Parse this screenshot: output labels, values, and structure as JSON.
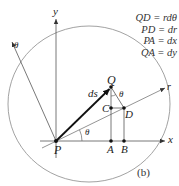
{
  "figure": {
    "caption": "(b)",
    "equations": [
      {
        "lhs": "QD",
        "rhs": "rdθ",
        "text": "QD = rdθ"
      },
      {
        "lhs": "PD",
        "rhs": "dr",
        "text": "PD = dr"
      },
      {
        "lhs": "PA",
        "rhs": "dx",
        "text": "PA = dx"
      },
      {
        "lhs": "QA",
        "rhs": "dy",
        "text": "QA = dy"
      }
    ],
    "axes": {
      "x_label": "x",
      "y_label": "y",
      "r_label": "r",
      "theta_axis_label": "θ"
    },
    "points": {
      "P": "P",
      "Q": "Q",
      "C": "C",
      "D": "D",
      "A": "A",
      "B": "B"
    },
    "vector_label": "ds",
    "angle_label_origin": "θ",
    "angle_label_QD": "θ",
    "colors": {
      "line": "#555555",
      "thin_line": "#888888",
      "vector": "#111111",
      "text": "#222222"
    }
  }
}
